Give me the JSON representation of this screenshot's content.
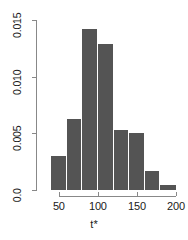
{
  "chart_data": {
    "type": "bar",
    "title": "",
    "subtitle": "",
    "xlabel": "t*",
    "ylabel": "",
    "bin_width": 20,
    "bin_edges": [
      40,
      60,
      80,
      100,
      120,
      140,
      160,
      180,
      200
    ],
    "categories": [
      "40-60",
      "60-80",
      "80-100",
      "100-120",
      "120-140",
      "140-160",
      "160-180",
      "180-200"
    ],
    "values": [
      0.003,
      0.0063,
      0.0142,
      0.0129,
      0.0053,
      0.005,
      0.0017,
      0.0004
    ],
    "bin_centers": [
      50,
      70,
      90,
      110,
      130,
      150,
      170,
      190
    ],
    "xlim": [
      40,
      200
    ],
    "ylim": [
      0.0,
      0.015
    ],
    "x_ticks": [
      50,
      100,
      150,
      200
    ],
    "x_tick_labels": [
      "50",
      "100",
      "150",
      "200"
    ],
    "y_ticks": [
      0.0,
      0.005,
      0.01,
      0.015
    ],
    "y_tick_labels": [
      "0.0",
      "0.005",
      "0.010",
      "0.015"
    ],
    "grid": false,
    "legend": null,
    "bar_color": "#545454",
    "axis_color": "#888888",
    "text_color": "#1a1a1a",
    "background": "#ffffff"
  },
  "axes": {
    "x_title": "t*",
    "y_title": ""
  }
}
